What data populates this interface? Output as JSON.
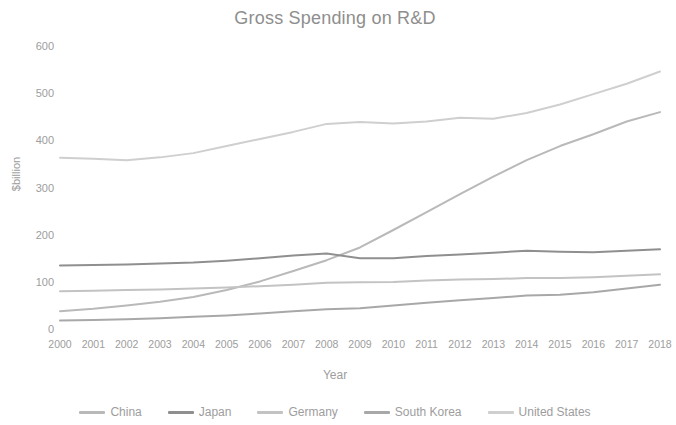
{
  "chart_data": {
    "type": "line",
    "title": "Gross Spending on R&D",
    "xlabel": "Year",
    "ylabel": "$billion",
    "grid": false,
    "legend_position": "bottom",
    "xlim": [
      2000,
      2018
    ],
    "ylim": [
      0,
      600
    ],
    "yticks": [
      "600",
      "500",
      "400",
      "300",
      "200",
      "100",
      "0"
    ],
    "ytick_values": [
      600,
      500,
      400,
      300,
      200,
      100,
      0
    ],
    "categories": [
      "2000",
      "2001",
      "2002",
      "2003",
      "2004",
      "2005",
      "2006",
      "2007",
      "2008",
      "2009",
      "2010",
      "2011",
      "2012",
      "2013",
      "2014",
      "2015",
      "2016",
      "2017",
      "2018"
    ],
    "series": [
      {
        "name": "China",
        "color": "#b9b9b9",
        "values": [
          40,
          45,
          52,
          60,
          70,
          85,
          103,
          125,
          148,
          175,
          212,
          250,
          288,
          325,
          360,
          390,
          415,
          442,
          462
        ]
      },
      {
        "name": "Japan",
        "color": "#8f8f8f",
        "values": [
          137,
          138,
          139,
          141,
          143,
          147,
          152,
          158,
          162,
          152,
          152,
          157,
          160,
          164,
          168,
          166,
          165,
          168,
          171
        ]
      },
      {
        "name": "Germany",
        "color": "#c3c3c3",
        "values": [
          82,
          83,
          85,
          86,
          88,
          90,
          93,
          96,
          100,
          101,
          102,
          105,
          107,
          108,
          110,
          110,
          112,
          115,
          118
        ]
      },
      {
        "name": "South Korea",
        "color": "#a8a8a8",
        "values": [
          20,
          21,
          23,
          25,
          28,
          31,
          35,
          40,
          44,
          46,
          52,
          58,
          63,
          68,
          73,
          75,
          80,
          88,
          96
        ]
      },
      {
        "name": "United States",
        "color": "#cfcfcf",
        "values": [
          365,
          363,
          360,
          366,
          375,
          390,
          405,
          420,
          437,
          441,
          438,
          442,
          450,
          448,
          460,
          478,
          500,
          522,
          548
        ]
      }
    ]
  }
}
